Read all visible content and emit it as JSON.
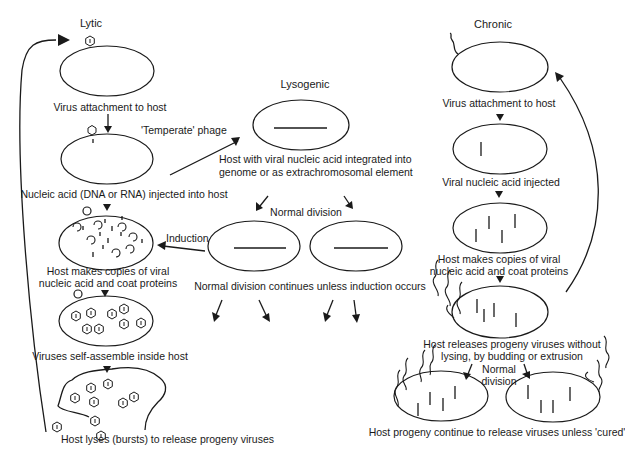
{
  "headers": {
    "lytic": "Lytic",
    "lysogenic": "Lysogenic",
    "chronic": "Chronic"
  },
  "lytic": {
    "step1": "Virus attachment to host",
    "step2": "Nucleic acid (DNA or RNA) injected into host",
    "step3_line1": "Host makes copies of viral",
    "step3_line2": "nucleic acid and coat proteins",
    "step4": "Viruses self-assemble inside host",
    "step5": "Host lyses (bursts) to release progeny viruses"
  },
  "lysogenic": {
    "temperate": "'Temperate' phage",
    "integrated_line1": "Host with viral nucleic acid integrated into",
    "integrated_line2": "genome or as extrachromosomal element",
    "normal_division": "Normal division",
    "induction": "Induction",
    "continues": "Normal division continues unless induction occurs"
  },
  "chronic": {
    "step1": "Virus attachment to host",
    "step2": "Viral nucleic acid injected",
    "step3_line1": "Host makes copies of viral",
    "step3_line2": "nucleic acid and coat proteins",
    "step4_line1": "Host releases progeny viruses without",
    "step4_line2": "lysing, by budding or extrusion",
    "division_line1": "Normal",
    "division_line2": "division",
    "step5": "Host progeny continue to release viruses unless 'cured'"
  },
  "colors": {
    "ink": "#1a1a1a",
    "background": "#ffffff"
  }
}
